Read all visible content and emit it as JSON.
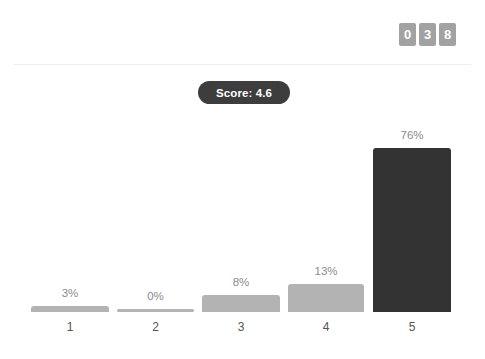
{
  "header": {
    "counter_digits": [
      "0",
      "3",
      "8"
    ]
  },
  "score_badge": {
    "label": "Score: 4.6"
  },
  "chart_data": {
    "type": "bar",
    "title": "Score: 4.6",
    "xlabel": "",
    "ylabel": "",
    "ylim": [
      0,
      100
    ],
    "grid": false,
    "legend": null,
    "categories": [
      "1",
      "2",
      "3",
      "4",
      "5"
    ],
    "values": [
      3,
      0,
      8,
      13,
      76
    ],
    "value_labels": [
      "3%",
      "0%",
      "8%",
      "13%",
      "76%"
    ],
    "colors": [
      "#b3b3b3",
      "#b3b3b3",
      "#b3b3b3",
      "#b3b3b3",
      "#333333"
    ],
    "highlight_index": 4
  },
  "colors": {
    "bar_default": "#b3b3b3",
    "bar_highlight": "#333333",
    "badge_background": "#3d3d3d",
    "badge_text": "#ffffff",
    "digit_background": "#a2a2a2",
    "digit_text": "#ffffff",
    "value_label": "#8c8c8c",
    "category_label": "#555555",
    "divider": "#eeeeee",
    "page_background": "#ffffff"
  }
}
